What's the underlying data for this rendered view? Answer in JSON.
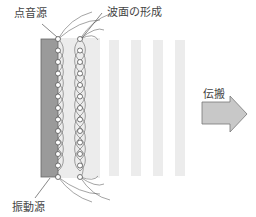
{
  "labels": {
    "point_source": "点音源",
    "wavefront": "波面の形成",
    "vibration_source": "振動源",
    "propagation": "伝搬"
  },
  "colors": {
    "source_fill": "#9a9a9a",
    "wave_fill": "#e8e8e8",
    "stripe_fill": "#ececec",
    "arrow_fill": "#c8c8c8",
    "line": "#555555"
  },
  "diagram": {
    "point_sources_per_column": 13,
    "columns": 2,
    "stripes": 4
  }
}
